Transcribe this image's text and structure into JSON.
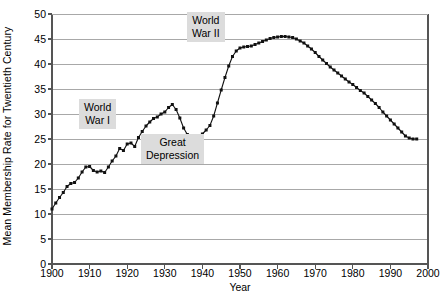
{
  "chart_data": {
    "type": "line",
    "title": "",
    "xlabel": "Year",
    "ylabel": "Mean Membership Rate for Twentieth Century",
    "xlim": [
      1900,
      2000
    ],
    "ylim": [
      0,
      50
    ],
    "xticks": [
      1900,
      1910,
      1920,
      1930,
      1940,
      1950,
      1960,
      1970,
      1980,
      1990,
      2000
    ],
    "yticks": [
      0,
      5,
      10,
      15,
      20,
      25,
      30,
      35,
      40,
      45,
      50
    ],
    "grid": "horizontal",
    "legend": "none",
    "marker": "filled-square",
    "series": [
      {
        "name": "Mean Membership Rate",
        "x": [
          1900,
          1901,
          1902,
          1903,
          1904,
          1905,
          1906,
          1907,
          1908,
          1909,
          1910,
          1911,
          1912,
          1913,
          1914,
          1915,
          1916,
          1917,
          1918,
          1919,
          1920,
          1921,
          1922,
          1923,
          1924,
          1925,
          1926,
          1927,
          1928,
          1929,
          1930,
          1931,
          1932,
          1933,
          1934,
          1935,
          1936,
          1937,
          1938,
          1939,
          1940,
          1941,
          1942,
          1943,
          1944,
          1945,
          1946,
          1947,
          1948,
          1949,
          1950,
          1951,
          1952,
          1953,
          1954,
          1955,
          1956,
          1957,
          1958,
          1959,
          1960,
          1961,
          1962,
          1963,
          1964,
          1965,
          1966,
          1967,
          1968,
          1969,
          1970,
          1971,
          1972,
          1973,
          1974,
          1975,
          1976,
          1977,
          1978,
          1979,
          1980,
          1981,
          1982,
          1983,
          1984,
          1985,
          1986,
          1987,
          1988,
          1989,
          1990,
          1991,
          1992,
          1993,
          1994,
          1995,
          1996,
          1997
        ],
        "values": [
          11.0,
          12.2,
          13.3,
          14.3,
          15.5,
          16.1,
          16.3,
          17.2,
          18.4,
          19.4,
          19.5,
          18.7,
          18.4,
          18.6,
          18.3,
          19.4,
          20.6,
          21.6,
          23.1,
          22.7,
          24.0,
          24.2,
          23.5,
          25.3,
          26.5,
          27.6,
          28.4,
          29.1,
          29.4,
          30.0,
          30.4,
          31.3,
          31.9,
          30.9,
          29.2,
          27.2,
          25.9,
          25.4,
          25.5,
          25.6,
          26.0,
          26.8,
          27.7,
          29.6,
          32.2,
          34.8,
          37.3,
          39.6,
          41.5,
          42.6,
          43.2,
          43.4,
          43.5,
          43.6,
          43.9,
          44.2,
          44.5,
          44.8,
          45.1,
          45.3,
          45.4,
          45.5,
          45.5,
          45.4,
          45.3,
          45.0,
          44.6,
          44.2,
          43.6,
          43.0,
          42.3,
          41.5,
          40.8,
          40.1,
          39.4,
          38.8,
          38.2,
          37.6,
          37.0,
          36.4,
          35.9,
          35.3,
          34.7,
          34.2,
          33.5,
          32.8,
          32.1,
          31.3,
          30.4,
          29.6,
          28.8,
          28.0,
          27.2,
          26.4,
          25.6,
          25.2,
          25.0,
          25.0
        ]
      }
    ],
    "annotations": [
      {
        "id": "world-war-i",
        "text": "World\nWar I",
        "year": 1912,
        "value": 30.0
      },
      {
        "id": "world-war-ii",
        "text": "World\nWar II",
        "year": 1941,
        "value": 47.5
      },
      {
        "id": "great-depression",
        "text": "Great\nDepression",
        "year": 1932,
        "value": 23.0
      }
    ],
    "colors": {
      "marker": "#111111",
      "line": "#111111",
      "grid": "#a8a8a8",
      "axis": "#555555",
      "annotation_bg": "#dcdcdc",
      "background": "#ffffff"
    }
  }
}
